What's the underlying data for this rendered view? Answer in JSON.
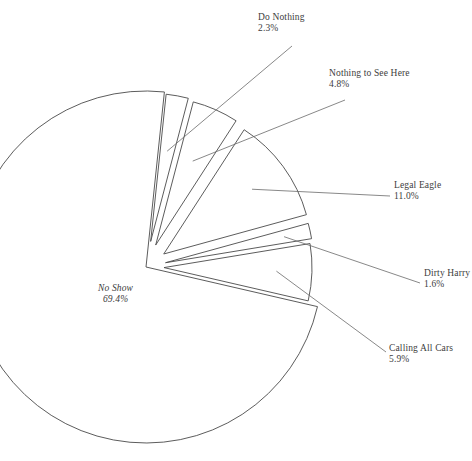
{
  "chart_data": {
    "type": "pie",
    "title": "",
    "subtitle": "",
    "xlabel": "",
    "ylabel": "",
    "legend_position": "none",
    "grid": false,
    "exploded": true,
    "value_unit": "%",
    "categories": [
      "No Show",
      "Do Nothing",
      "Nothing to See Here",
      "Legal Eagle",
      "Dirty Harry",
      "Calling All Cars"
    ],
    "values": [
      69.4,
      2.3,
      4.8,
      11.0,
      1.6,
      5.9
    ],
    "slices": [
      {
        "label": "No Show",
        "percent_text": "69.4%",
        "value": 69.4,
        "fill_pattern": "none",
        "label_position": "inside",
        "leader_line": false
      },
      {
        "label": "Do Nothing",
        "percent_text": "2.3%",
        "value": 2.3,
        "fill_pattern": "diagonal-hatch",
        "label_position": "outside-top",
        "leader_line": true
      },
      {
        "label": "Nothing to See Here",
        "percent_text": "4.8%",
        "value": 4.8,
        "fill_pattern": "horizontal-hatch",
        "label_position": "outside-top-right",
        "leader_line": true
      },
      {
        "label": "Legal Eagle",
        "percent_text": "11.0%",
        "value": 11.0,
        "fill_pattern": "crosshatch-grid",
        "label_position": "outside-right",
        "leader_line": true
      },
      {
        "label": "Dirty Harry",
        "percent_text": "1.6%",
        "value": 1.6,
        "fill_pattern": "horizontal-hatch",
        "label_position": "outside-right",
        "leader_line": true
      },
      {
        "label": "Calling All Cars",
        "percent_text": "5.9%",
        "value": 5.9,
        "fill_pattern": "vertical-hatch",
        "label_position": "outside-bottom-right",
        "leader_line": true
      }
    ],
    "colors": {
      "background": "#ffffff",
      "outline": "#4a4a4a",
      "hatch": "#555555",
      "text": "#3d3d3d",
      "leader": "#6a6a6a"
    }
  }
}
